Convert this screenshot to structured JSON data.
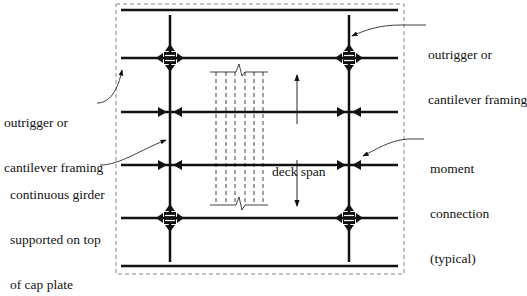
{
  "labels": {
    "outrigger_left_line1": "outrigger or",
    "outrigger_left_line2": "cantilever framing",
    "outrigger_right_line1": "outrigger or",
    "outrigger_right_line2": "cantilever framing",
    "girder_line1": "continuous girder",
    "girder_line2": "supported on top",
    "girder_line3": "of cap plate",
    "deck_span": "deck span",
    "moment_line1": "moment",
    "moment_line2": "connection",
    "moment_line3": "(typical)"
  },
  "colors": {
    "line": "#111111",
    "dashed_border": "#888888"
  }
}
